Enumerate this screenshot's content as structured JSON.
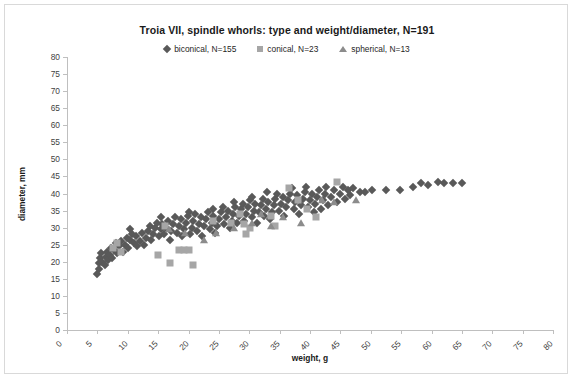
{
  "chart_data": {
    "type": "scatter",
    "title": "Troia VII, spindle whorls: type and weight/diameter, N=191",
    "xlabel": "weight, g",
    "ylabel": "diameter, mm",
    "xlim": [
      0,
      80
    ],
    "ylim": [
      0,
      80
    ],
    "xticks": [
      0,
      5,
      10,
      15,
      20,
      25,
      30,
      35,
      40,
      45,
      50,
      55,
      60,
      65,
      70,
      75,
      80
    ],
    "yticks": [
      0,
      5,
      10,
      15,
      20,
      25,
      30,
      35,
      40,
      45,
      50,
      55,
      60,
      65,
      70,
      75,
      80
    ],
    "grid": false,
    "legend_position": "top-center",
    "colors": {
      "biconical": "#595959",
      "conical": "#a6a6a6",
      "spherical": "#8c8c8c",
      "axis": "#bfbfbf",
      "text": "#3f3f3f",
      "frame": "#d9d9d9"
    },
    "series": [
      {
        "name": "biconical, N=155",
        "marker": "diamond",
        "color": "#595959",
        "points": [
          [
            5.0,
            16.5
          ],
          [
            5.2,
            18.0
          ],
          [
            5.3,
            19.5
          ],
          [
            5.4,
            21.0
          ],
          [
            5.6,
            22.5
          ],
          [
            5.8,
            20.0
          ],
          [
            6.2,
            19.0
          ],
          [
            6.4,
            21.5
          ],
          [
            6.6,
            23.0
          ],
          [
            6.8,
            20.5
          ],
          [
            7.0,
            22.0
          ],
          [
            7.2,
            24.0
          ],
          [
            7.4,
            21.0
          ],
          [
            7.8,
            23.5
          ],
          [
            8.0,
            25.5
          ],
          [
            8.3,
            22.5
          ],
          [
            8.6,
            24.5
          ],
          [
            8.9,
            26.0
          ],
          [
            9.2,
            23.0
          ],
          [
            9.5,
            25.0
          ],
          [
            9.8,
            27.0
          ],
          [
            10.1,
            24.0
          ],
          [
            10.4,
            26.5
          ],
          [
            10.7,
            28.0
          ],
          [
            10.4,
            29.5
          ],
          [
            11.0,
            25.5
          ],
          [
            11.3,
            27.5
          ],
          [
            11.6,
            24.5
          ],
          [
            12.0,
            26.0
          ],
          [
            12.3,
            28.5
          ],
          [
            12.6,
            25.0
          ],
          [
            13.0,
            27.0
          ],
          [
            13.3,
            29.0
          ],
          [
            13.6,
            30.5
          ],
          [
            13.9,
            26.5
          ],
          [
            14.2,
            28.0
          ],
          [
            14.5,
            30.0
          ],
          [
            14.8,
            31.5
          ],
          [
            15.1,
            27.5
          ],
          [
            15.4,
            29.5
          ],
          [
            15.7,
            31.0
          ],
          [
            15.4,
            33.0
          ],
          [
            16.0,
            28.0
          ],
          [
            16.3,
            30.0
          ],
          [
            16.6,
            32.0
          ],
          [
            16.9,
            26.5
          ],
          [
            17.2,
            29.0
          ],
          [
            17.5,
            31.0
          ],
          [
            17.8,
            33.0
          ],
          [
            18.1,
            28.5
          ],
          [
            18.4,
            30.5
          ],
          [
            18.7,
            32.5
          ],
          [
            19.0,
            27.5
          ],
          [
            19.3,
            29.5
          ],
          [
            19.6,
            31.5
          ],
          [
            19.9,
            33.5
          ],
          [
            20.2,
            28.0
          ],
          [
            20.5,
            30.0
          ],
          [
            20.8,
            32.0
          ],
          [
            21.1,
            34.0
          ],
          [
            21.4,
            29.0
          ],
          [
            21.7,
            31.0
          ],
          [
            22.0,
            33.0
          ],
          [
            22.3,
            27.5
          ],
          [
            22.6,
            30.5
          ],
          [
            22.9,
            32.5
          ],
          [
            23.2,
            34.5
          ],
          [
            23.5,
            29.5
          ],
          [
            23.8,
            31.5
          ],
          [
            24.1,
            33.5
          ],
          [
            24.4,
            28.5
          ],
          [
            24.7,
            30.5
          ],
          [
            25.0,
            32.5
          ],
          [
            25.3,
            34.5
          ],
          [
            25.6,
            36.0
          ],
          [
            25.9,
            31.0
          ],
          [
            26.2,
            33.0
          ],
          [
            26.5,
            35.0
          ],
          [
            26.8,
            30.0
          ],
          [
            27.1,
            32.0
          ],
          [
            27.4,
            34.0
          ],
          [
            27.7,
            36.0
          ],
          [
            28.0,
            31.5
          ],
          [
            28.3,
            33.5
          ],
          [
            28.6,
            35.5
          ],
          [
            28.9,
            37.0
          ],
          [
            29.2,
            32.0
          ],
          [
            29.5,
            34.0
          ],
          [
            29.8,
            36.0
          ],
          [
            30.1,
            38.0
          ],
          [
            30.4,
            33.0
          ],
          [
            30.7,
            35.0
          ],
          [
            31.0,
            37.0
          ],
          [
            31.3,
            31.5
          ],
          [
            31.6,
            34.5
          ],
          [
            31.9,
            36.5
          ],
          [
            32.2,
            38.5
          ],
          [
            32.5,
            33.5
          ],
          [
            32.8,
            35.5
          ],
          [
            33.1,
            37.5
          ],
          [
            33.4,
            32.5
          ],
          [
            33.7,
            34.5
          ],
          [
            34.0,
            36.5
          ],
          [
            34.3,
            38.5
          ],
          [
            34.6,
            40.0
          ],
          [
            34.9,
            35.0
          ],
          [
            35.2,
            37.0
          ],
          [
            35.5,
            39.0
          ],
          [
            35.8,
            33.5
          ],
          [
            36.1,
            36.0
          ],
          [
            36.4,
            38.0
          ],
          [
            36.7,
            40.0
          ],
          [
            37.0,
            41.5
          ],
          [
            37.3,
            35.5
          ],
          [
            37.6,
            37.5
          ],
          [
            37.9,
            39.5
          ],
          [
            38.2,
            34.0
          ],
          [
            38.5,
            36.5
          ],
          [
            38.8,
            38.5
          ],
          [
            39.1,
            40.5
          ],
          [
            39.4,
            42.0
          ],
          [
            39.7,
            36.0
          ],
          [
            40.0,
            38.0
          ],
          [
            40.3,
            40.0
          ],
          [
            40.6,
            34.5
          ],
          [
            40.9,
            37.0
          ],
          [
            41.2,
            39.0
          ],
          [
            41.5,
            41.0
          ],
          [
            41.8,
            35.5
          ],
          [
            42.1,
            38.0
          ],
          [
            42.4,
            40.0
          ],
          [
            42.7,
            42.0
          ],
          [
            43.0,
            36.5
          ],
          [
            43.5,
            39.0
          ],
          [
            44.0,
            41.0
          ],
          [
            44.5,
            37.5
          ],
          [
            45.0,
            40.0
          ],
          [
            45.4,
            42.0
          ],
          [
            45.8,
            38.5
          ],
          [
            46.2,
            41.0
          ],
          [
            46.6,
            39.5
          ],
          [
            47.0,
            41.5
          ],
          [
            48.2,
            40.5
          ],
          [
            49.0,
            40.5
          ],
          [
            50.2,
            41.0
          ],
          [
            52.5,
            41.0
          ],
          [
            54.8,
            41.0
          ],
          [
            57.0,
            42.0
          ],
          [
            58.2,
            43.0
          ],
          [
            59.5,
            42.5
          ],
          [
            61.0,
            43.5
          ],
          [
            62.0,
            43.0
          ],
          [
            63.5,
            43.0
          ],
          [
            65.0,
            43.0
          ],
          [
            33.0,
            40.5
          ],
          [
            30.5,
            39.0
          ],
          [
            27.5,
            37.5
          ],
          [
            24.0,
            35.5
          ],
          [
            20.0,
            34.5
          ]
        ]
      },
      {
        "name": "conical, N=23",
        "marker": "square",
        "color": "#a6a6a6",
        "points": [
          [
            7.5,
            24.0
          ],
          [
            8.2,
            25.5
          ],
          [
            8.9,
            23.0
          ],
          [
            15.0,
            22.0
          ],
          [
            16.2,
            30.5
          ],
          [
            17.0,
            19.5
          ],
          [
            18.5,
            23.5
          ],
          [
            19.2,
            23.5
          ],
          [
            20.0,
            23.5
          ],
          [
            20.8,
            19.0
          ],
          [
            24.0,
            32.0
          ],
          [
            27.0,
            31.5
          ],
          [
            28.5,
            34.0
          ],
          [
            29.2,
            31.0
          ],
          [
            29.5,
            28.0
          ],
          [
            30.2,
            30.0
          ],
          [
            33.5,
            33.5
          ],
          [
            34.2,
            30.5
          ],
          [
            36.5,
            41.5
          ],
          [
            38.0,
            38.0
          ],
          [
            39.5,
            35.5
          ],
          [
            41.0,
            33.0
          ],
          [
            44.5,
            43.5
          ]
        ]
      },
      {
        "name": "spherical, N=13",
        "marker": "triangle",
        "color": "#8c8c8c",
        "points": [
          [
            16.8,
            29.5
          ],
          [
            19.5,
            28.5
          ],
          [
            22.5,
            26.5
          ],
          [
            24.5,
            28.5
          ],
          [
            27.5,
            30.0
          ],
          [
            30.5,
            31.5
          ],
          [
            32.0,
            34.0
          ],
          [
            33.5,
            30.5
          ],
          [
            35.5,
            33.0
          ],
          [
            38.5,
            31.5
          ],
          [
            42.0,
            38.0
          ],
          [
            44.0,
            37.5
          ],
          [
            47.5,
            38.0
          ]
        ]
      }
    ]
  }
}
